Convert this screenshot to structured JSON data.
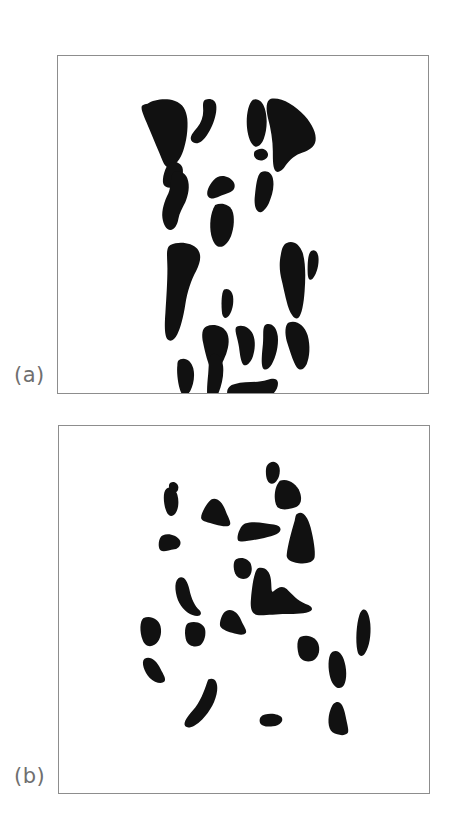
{
  "figure": {
    "kind": "emergent-perception-figure",
    "background_color": "#ffffff",
    "ink_color": "#111111",
    "frame_color": "#8d8d8d",
    "caption_color": "#6f6f6f",
    "width": 459,
    "height": 817
  },
  "panels": [
    {
      "id": "a",
      "caption": "(a)",
      "subject": "dalmatian-dog-silhouette-fragments",
      "frame": {
        "x": 57,
        "y": 55,
        "width": 372,
        "height": 339
      },
      "blob_count": 21,
      "viewbox": "0 0 372 339",
      "blobs": [
        {
          "name": "head-left-ear-mass",
          "d": "M90,48 C96,44 108,42 117,45 C126,48 129,55 130,63 C131,74 129,86 126,95 C123,104 118,110 113,112 C110,113 107,110 105,105 C101,95 96,84 92,74 C88,64 84,56 84,52 C84,49 86,49 90,48 Z"
        },
        {
          "name": "head-forehead-stripe",
          "d": "M148,44 C153,42 158,44 159,49 C160,55 158,63 155,70 C152,77 148,83 144,86 C140,89 136,88 134,85 C132,81 136,77 140,72 C144,67 146,61 146,55 C146,50 145,46 148,44 Z"
        },
        {
          "name": "muzzle-left-fleck",
          "d": "M112,108 C117,105 123,107 125,112 C127,118 124,126 119,130 C114,134 108,133 106,129 C104,124 108,111 112,108 Z"
        },
        {
          "name": "head-right-ear-top",
          "d": "M196,44 C201,42 206,46 208,53 C211,63 210,75 207,83 C205,89 201,92 198,91 C194,89 191,82 190,72 C189,61 191,48 196,44 Z"
        },
        {
          "name": "head-right-ear-large",
          "d": "M214,43 C224,41 238,49 248,60 C256,69 260,78 259,85 C258,92 252,95 246,97 C239,99 233,104 229,110 C226,115 222,118 219,116 C216,113 216,105 216,96 C216,85 214,73 211,62 C209,53 209,45 214,43 Z"
        },
        {
          "name": "cheek-dot",
          "d": "M201,94 C205,92 210,94 211,98 C212,102 208,105 204,105 C200,105 197,102 197,99 C197,96 198,95 201,94 Z"
        },
        {
          "name": "neck-left-blob",
          "d": "M116,117 C121,114 128,117 130,123 C133,131 131,140 128,147 C125,153 122,158 121,164 C120,170 117,175 113,175 C109,175 106,170 105,163 C104,155 107,146 111,138 C114,131 113,121 116,117 Z"
        },
        {
          "name": "collar-center-left",
          "d": "M160,122 C166,119 173,122 176,126 C179,130 178,135 173,137 C167,139 161,142 157,143 C153,144 150,142 150,138 C150,133 155,125 160,122 Z"
        },
        {
          "name": "chest-center-triangle",
          "d": "M158,150 C164,147 172,149 175,155 C178,162 177,173 174,181 C171,188 167,192 163,192 C159,192 156,188 154,180 C152,171 153,158 158,150 Z"
        },
        {
          "name": "neck-right-blob",
          "d": "M204,117 C209,114 215,117 216,123 C218,132 215,141 212,148 C209,154 205,158 202,157 C198,155 197,148 198,140 C199,131 200,120 204,117 Z"
        },
        {
          "name": "body-left-long-stripe",
          "d": "M113,190 C122,186 135,188 140,194 C145,200 143,208 139,216 C134,225 130,237 128,250 C126,263 123,274 120,280 C117,286 113,288 110,285 C107,281 107,271 108,258 C109,243 110,227 110,214 C110,202 108,193 113,190 Z"
        },
        {
          "name": "body-right-long-stripe",
          "d": "M230,188 C236,185 243,189 246,198 C249,208 249,222 248,236 C247,250 245,260 242,263 C239,266 235,262 232,254 C229,245 227,234 225,226 C223,218 222,210 224,200 C225,193 227,189 230,188 Z"
        },
        {
          "name": "belly-small-wedge",
          "d": "M167,235 C171,233 175,236 176,242 C177,249 175,257 172,261 C169,265 166,264 165,259 C164,252 164,238 167,235 Z"
        },
        {
          "name": "leg-front-left",
          "d": "M149,272 C156,269 165,271 169,277 C173,283 172,292 169,300 C166,307 163,314 161,317 C159,320 156,320 154,316 C151,310 148,299 146,289 C144,280 145,274 149,272 Z"
        },
        {
          "name": "leg-front-center-zig",
          "d": "M180,272 C186,270 193,273 196,280 C199,287 198,296 196,302 C194,308 190,312 187,311 C184,309 183,301 182,293 C181,284 176,274 180,272 Z"
        },
        {
          "name": "leg-front-right-curve",
          "d": "M209,270 C215,268 220,273 221,282 C222,292 219,303 215,310 C212,315 208,317 206,314 C204,310 205,300 206,290 C207,281 205,272 209,270 Z"
        },
        {
          "name": "hind-leg-right-long",
          "d": "M232,268 C240,265 248,271 251,281 C254,292 253,303 250,310 C247,316 243,317 240,313 C236,307 233,296 230,287 C228,279 228,270 232,268 Z"
        },
        {
          "name": "paw-left-blob",
          "d": "M123,305 C129,303 134,307 136,314 C138,322 136,331 133,337 C130,342 126,343 124,339 C121,333 119,319 120,311 C120,307 121,306 123,305 Z"
        },
        {
          "name": "paw-center-curve",
          "d": "M155,300 C160,298 165,303 166,312 C167,322 164,334 160,342 C157,348 153,350 151,346 C149,341 150,330 151,320 C152,310 151,302 155,300 Z"
        },
        {
          "name": "paw-shadow-bottom",
          "d": "M178,330 C188,327 202,329 210,326 C216,324 220,324 221,328 C222,333 218,340 211,344 C203,348 191,350 182,349 C174,348 170,344 170,339 C170,334 173,331 178,330 Z"
        },
        {
          "name": "shoulder-right-hook",
          "d": "M255,196 C259,194 262,198 262,205 C262,213 259,221 256,224 C253,227 251,224 251,217 C251,209 251,198 255,196 Z"
        }
      ]
    },
    {
      "id": "b",
      "caption": "(b)",
      "subject": "scrambled-fragments-no-figure",
      "frame": {
        "x": 58,
        "y": 425,
        "width": 372,
        "height": 369
      },
      "blob_count": 21,
      "viewbox": "0 0 372 369",
      "blobs": [
        {
          "name": "fragment-top-left-spike",
          "d": "M108,63 C112,60 117,63 119,69 C121,76 120,84 117,88 C114,92 110,91 108,86 C105,79 104,66 108,63 Z"
        },
        {
          "name": "fragment-upper-left-triangle",
          "d": "M153,74 C158,71 164,76 167,84 C170,92 173,96 172,99 C171,102 164,101 157,99 C150,97 144,96 143,93 C142,89 148,78 153,74 Z"
        },
        {
          "name": "fragment-mid-left-hook",
          "d": "M104,110 C110,107 118,110 121,114 C124,118 121,123 116,124 C110,125 105,127 102,125 C99,122 100,112 104,110 Z"
        },
        {
          "name": "fragment-top-right-small",
          "d": "M212,37 C217,34 222,38 222,45 C222,52 218,58 214,58 C210,58 208,53 208,46 C208,41 209,39 212,37 Z"
        },
        {
          "name": "fragment-top-right-chunk",
          "d": "M222,55 C230,52 239,58 242,66 C245,74 243,80 237,82 C231,84 224,85 220,82 C216,78 215,63 222,55 Z"
        },
        {
          "name": "fragment-right-cone",
          "d": "M240,88 C245,85 250,91 253,102 C256,114 258,126 257,132 C256,137 249,139 241,138 C233,137 228,134 229,129 C230,120 234,105 237,95 C238,90 238,89 240,88 Z"
        },
        {
          "name": "fragment-center-bar",
          "d": "M187,98 C196,95 208,98 216,99 C222,100 224,103 222,106 C219,110 209,112 199,114 C189,116 182,117 180,115 C178,112 182,100 187,98 Z"
        },
        {
          "name": "fragment-center-small-wedge",
          "d": "M178,134 C184,131 191,134 193,139 C195,145 193,151 189,153 C184,155 179,153 177,148 C175,143 175,136 178,134 Z"
        },
        {
          "name": "fragment-center-tree",
          "d": "M200,143 C207,141 212,146 213,154 C214,162 213,169 216,166 C220,162 225,160 229,164 C234,169 240,176 248,179 C254,181 256,184 253,186 C248,189 238,189 228,189 C217,189 205,191 199,190 C194,189 192,184 193,174 C194,162 196,146 200,143 Z"
        },
        {
          "name": "fragment-mid-left-crescent",
          "d": "M120,153 C125,150 129,155 131,164 C133,174 137,182 141,185 C144,188 143,191 139,191 C133,191 125,186 121,178 C117,170 115,157 120,153 Z"
        },
        {
          "name": "fragment-left-round",
          "d": "M85,193 C92,190 100,194 102,201 C104,209 101,217 96,220 C91,223 86,221 84,215 C81,207 81,196 85,193 Z"
        },
        {
          "name": "fragment-left-mid-square",
          "d": "M130,198 C138,195 146,199 147,205 C148,212 145,219 141,221 C136,223 130,221 128,216 C126,210 126,200 130,198 Z"
        },
        {
          "name": "fragment-center-arrow",
          "d": "M168,186 C174,183 180,188 183,195 C186,202 189,205 188,208 C186,211 180,210 174,208 C168,206 163,204 162,201 C161,197 164,188 168,186 Z"
        },
        {
          "name": "fragment-right-sliver",
          "d": "M305,185 C309,183 312,189 313,199 C314,210 312,222 308,228 C305,233 301,232 300,226 C298,216 299,199 302,190 C303,187 304,186 305,185 Z"
        },
        {
          "name": "fragment-right-square",
          "d": "M243,212 C251,209 259,213 261,220 C263,227 260,234 255,236 C249,238 243,236 241,230 C239,223 239,214 243,212 Z"
        },
        {
          "name": "fragment-right-mid-wedge",
          "d": "M275,227 C281,224 286,230 288,241 C290,252 288,261 284,263 C279,265 274,260 272,250 C270,240 271,229 275,227 Z"
        },
        {
          "name": "fragment-lower-left-triangle",
          "d": "M86,234 C92,231 98,236 102,244 C105,250 108,254 106,257 C103,260 96,258 91,253 C86,248 82,237 86,234 Z"
        },
        {
          "name": "fragment-lower-left-curve",
          "d": "M150,255 C156,252 160,257 159,266 C158,276 152,287 144,295 C137,302 130,305 127,302 C124,298 130,291 137,283 C144,274 147,263 150,255 Z"
        },
        {
          "name": "fragment-bottom-small-bar",
          "d": "M207,290 C214,288 222,290 224,293 C226,297 222,301 215,302 C208,303 203,301 202,298 C201,294 203,291 207,290 Z"
        },
        {
          "name": "fragment-bottom-right-spike",
          "d": "M278,278 C283,276 286,281 288,291 C290,301 292,307 290,309 C287,312 280,311 275,308 C270,304 270,293 273,285 C275,280 276,279 278,278 Z"
        },
        {
          "name": "fragment-upper-left-corner-fleck",
          "d": "M112,57 C116,55 120,58 120,62 C120,66 117,68 114,67 C111,66 109,59 112,57 Z"
        }
      ]
    }
  ]
}
